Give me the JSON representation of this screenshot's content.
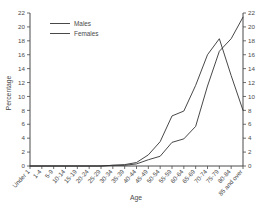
{
  "chart_data": {
    "type": "line",
    "title": "",
    "xlabel": "Age",
    "ylabel": "Percentage",
    "ylim": [
      0,
      22
    ],
    "ytick_step": 2,
    "yticks": [
      0,
      2,
      4,
      6,
      8,
      10,
      12,
      14,
      16,
      18,
      20,
      22
    ],
    "grid": false,
    "legend_position": "top-left",
    "right_axis_mirrored": true,
    "categories": [
      "Under 1",
      "1-4",
      "5-9",
      "10-14",
      "15-19",
      "20-24",
      "25-29",
      "30-34",
      "35-39",
      "40-44",
      "45-49",
      "50-54",
      "55-59",
      "60-64",
      "65-69",
      "70-74",
      "75-79",
      "80-84",
      "85 and over"
    ],
    "series": [
      {
        "name": "Males",
        "values": [
          0,
          0,
          0,
          0,
          0,
          0,
          0,
          0.1,
          0.2,
          0.5,
          1.6,
          3.5,
          7.2,
          7.9,
          11.6,
          16.0,
          18.3,
          13.0,
          8.0
        ]
      },
      {
        "name": "Females",
        "values": [
          0,
          0,
          0,
          0,
          0,
          0,
          0,
          0.1,
          0.1,
          0.3,
          0.9,
          1.4,
          3.4,
          3.9,
          5.7,
          11.5,
          16.5,
          18.3,
          21.4
        ]
      }
    ]
  },
  "legend": {
    "entries": [
      {
        "label": "Males"
      },
      {
        "label": "Females"
      }
    ]
  },
  "axes": {
    "y_left_label": "Percentage",
    "y_right_label": "",
    "x_label": "Age"
  },
  "colors": {
    "line": "#333333",
    "axis": "#4a4a4a",
    "text": "#4a4a4a",
    "background": "#ffffff"
  }
}
